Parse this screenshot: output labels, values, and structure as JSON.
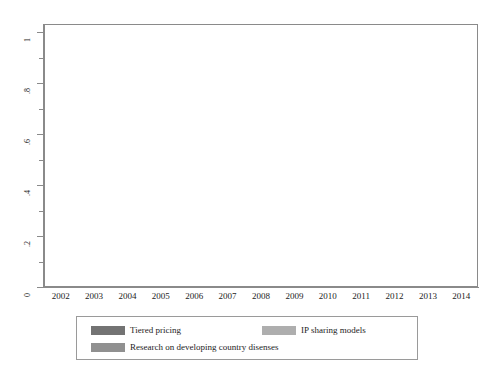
{
  "chart_data": {
    "type": "bar",
    "title": "",
    "subtitle": "",
    "xlabel": "",
    "ylabel": "",
    "categories": [
      "2002",
      "2003",
      "2004",
      "2005",
      "2006",
      "2007",
      "2008",
      "2009",
      "2010",
      "2011",
      "2012",
      "2013",
      "2014"
    ],
    "ylim": [
      0,
      1
    ],
    "ytick_labels": [
      "0",
      ".2",
      ".4",
      ".6",
      ".8",
      "1"
    ],
    "ytick_values": [
      0,
      0.2,
      0.4,
      0.6,
      0.8,
      1
    ],
    "minor_ticks": true,
    "grid": true,
    "grid_axis": "y",
    "legend_position": "bottom",
    "bar_mode": "grouped",
    "series": [
      {
        "name": "Tiered pricing",
        "color": "#737373",
        "values": [
          0.09,
          0.17,
          0.23,
          0.25,
          0.38,
          0.41,
          0.54,
          0.62,
          0.58,
          0.54,
          0.58,
          0.58,
          0.54
        ]
      },
      {
        "name": "IP sharing models",
        "color": "#aeaeae",
        "values": [
          0.09,
          0.06,
          0.09,
          0.21,
          0.33,
          0.29,
          0.4,
          0.4,
          0.4,
          0.45,
          0.45,
          0.45,
          0.45
        ]
      },
      {
        "name": "Research on developing country disenses",
        "color": "#909090",
        "values": [
          0.0,
          0.3,
          0.14,
          0.0,
          0.45,
          0.5,
          0.54,
          0.58,
          0.58,
          0.58,
          0.62,
          0.62,
          0.66
        ]
      }
    ]
  },
  "legend": {
    "entries": [
      {
        "label": "Tiered pricing",
        "swatch": "s0"
      },
      {
        "label": "IP sharing models",
        "swatch": "s1"
      },
      {
        "label": "Research on developing country disenses",
        "swatch": "s2"
      }
    ]
  }
}
